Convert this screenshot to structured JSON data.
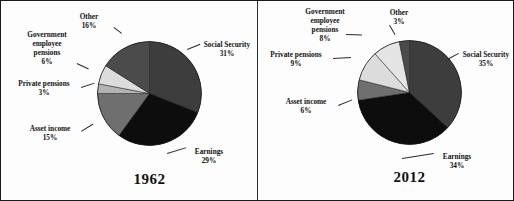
{
  "figure": {
    "border_color": "#1a1a1a",
    "background": "#fdfdfd"
  },
  "chart_data": [
    {
      "type": "pie",
      "title": "1962",
      "labels": [
        "Social Security",
        "Earnings",
        "Asset income",
        "Private pensions",
        "Government employee pensions",
        "Other"
      ],
      "values": [
        31,
        29,
        15,
        3,
        6,
        16
      ],
      "value_labels": [
        "31%",
        "29%",
        "15%",
        "3%",
        "6%",
        "16%"
      ],
      "colors": [
        "#3d3d3d",
        "#0d0d0d",
        "#6f6f6f",
        "#b3b3b3",
        "#dcdcdc",
        "#4b4b4b"
      ],
      "units": "percent",
      "legend": "none",
      "grid": false
    },
    {
      "type": "pie",
      "title": "2012",
      "labels": [
        "Social Security",
        "Earnings",
        "Asset income",
        "Private pensions",
        "Government employee pensions",
        "Other"
      ],
      "values": [
        35,
        34,
        6,
        9,
        8,
        3
      ],
      "value_labels": [
        "35%",
        "34%",
        "6%",
        "9%",
        "8%",
        "3%"
      ],
      "colors": [
        "#3d3d3d",
        "#0d0d0d",
        "#6f6f6f",
        "#dcdcdc",
        "#e4e4e4",
        "#4b4b4b"
      ],
      "units": "percent",
      "legend": "none",
      "grid": false
    }
  ],
  "left": {
    "year": "1962",
    "labels": {
      "social_security": {
        "name": "Social Security",
        "pct": "31%"
      },
      "earnings": {
        "name": "Earnings",
        "pct": "29%"
      },
      "asset_income": {
        "name": "Asset income",
        "pct": "15%"
      },
      "private_pensions": {
        "name": "Private pensions",
        "pct": "3%"
      },
      "gov_pensions_l1": "Government",
      "gov_pensions_l2": "employee",
      "gov_pensions_l3": "pensions",
      "gov_pensions_pct": "6%",
      "other": {
        "name": "Other",
        "pct": "16%"
      }
    }
  },
  "right": {
    "year": "2012",
    "labels": {
      "social_security": {
        "name": "Social Security",
        "pct": "35%"
      },
      "earnings": {
        "name": "Earnings",
        "pct": "34%"
      },
      "asset_income": {
        "name": "Asset income",
        "pct": "6%"
      },
      "private_pensions": {
        "name": "Private pensions",
        "pct": "9%"
      },
      "gov_pensions_l1": "Government",
      "gov_pensions_l2": "employee",
      "gov_pensions_l3": "pensions",
      "gov_pensions_pct": "8%",
      "other": {
        "name": "Other",
        "pct": "3%"
      }
    }
  }
}
